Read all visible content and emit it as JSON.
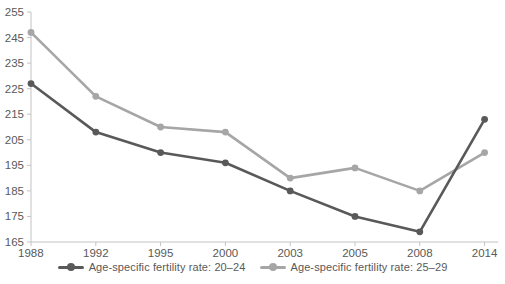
{
  "chart_data": {
    "type": "line",
    "title": "",
    "xlabel": "",
    "ylabel": "",
    "categories": [
      "1988",
      "1992",
      "1995",
      "2000",
      "2003",
      "2005",
      "2008",
      "2014"
    ],
    "series": [
      {
        "name": "Age-specific fertility rate: 20–24",
        "color": "#595959",
        "values": [
          227,
          208,
          200,
          196,
          185,
          175,
          169,
          213
        ]
      },
      {
        "name": "Age-specific fertility rate: 25–29",
        "color": "#a6a6a6",
        "values": [
          247,
          222,
          210,
          208,
          190,
          194,
          185,
          200
        ]
      }
    ],
    "y_ticks": [
      165,
      175,
      185,
      195,
      205,
      215,
      225,
      235,
      245,
      255
    ],
    "ylim": [
      165,
      255
    ],
    "grid": false,
    "legend_position": "bottom-center",
    "axis_color": "#c3c3c3",
    "tick_label_color": "#595959",
    "background_color": "#ffffff"
  }
}
